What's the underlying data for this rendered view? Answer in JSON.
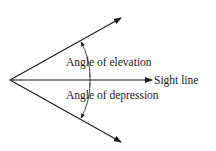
{
  "diagram": {
    "labels": {
      "elevation": "Angle of elevation",
      "sight_line": "Sight line",
      "depression": "Angle of depression"
    },
    "colors": {
      "ink": "#1a1a1a",
      "background": "#ffffff"
    }
  }
}
